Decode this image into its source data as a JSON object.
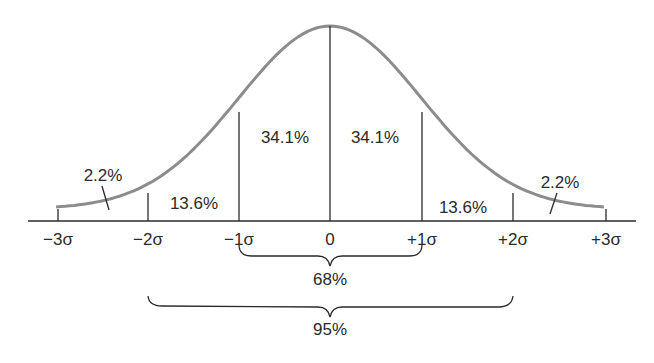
{
  "chart_data": {
    "type": "area",
    "title": "",
    "xlabel": "",
    "ylabel": "",
    "x_ticks": [
      "−3σ",
      "−2σ",
      "−1σ",
      "0",
      "+1σ",
      "+2σ",
      "+3σ"
    ],
    "x_values": [
      -3,
      -2,
      -1,
      0,
      1,
      2,
      3
    ],
    "regions": [
      {
        "from": -3,
        "to": -2,
        "percent": "2.2%"
      },
      {
        "from": -2,
        "to": -1,
        "percent": "13.6%"
      },
      {
        "from": -1,
        "to": 0,
        "percent": "34.1%"
      },
      {
        "from": 0,
        "to": 1,
        "percent": "34.1%"
      },
      {
        "from": 1,
        "to": 2,
        "percent": "13.6%"
      },
      {
        "from": 2,
        "to": 3,
        "percent": "2.2%"
      }
    ],
    "brackets": [
      {
        "from": -1,
        "to": 1,
        "label": "68%"
      },
      {
        "from": -2,
        "to": 2,
        "label": "95%"
      }
    ],
    "curve_color": "#8a8a8a",
    "line_color": "#2a2a2a",
    "grid": false,
    "legend": "none"
  },
  "labels": {
    "ticks": [
      "−3σ",
      "−2σ",
      "−1σ",
      "0",
      "+1σ",
      "+2σ",
      "+3σ"
    ],
    "regions": [
      "2.2%",
      "13.6%",
      "34.1%",
      "34.1%",
      "13.6%",
      "2.2%"
    ],
    "bracket_68": "68%",
    "bracket_95": "95%"
  }
}
